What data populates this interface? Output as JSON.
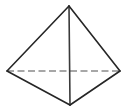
{
  "figure": {
    "shape_name": "tetrahedron",
    "background_color": "#ffffff",
    "visible_edge_color": "#262626",
    "hidden_edge_color": "#8a8a8a",
    "canvas": {
      "width": 127,
      "height": 111
    },
    "vertices": {
      "apex": {
        "label": "apex",
        "x": 69,
        "y": 6
      },
      "left": {
        "label": "left-rear",
        "x": 7,
        "y": 71
      },
      "right": {
        "label": "right-rear",
        "x": 120,
        "y": 71
      },
      "front": {
        "label": "front-bottom",
        "x": 70,
        "y": 105
      }
    },
    "edges": [
      {
        "name": "apex-to-left",
        "from": "apex",
        "to": "left",
        "style": "solid",
        "color": "#262626"
      },
      {
        "name": "apex-to-right",
        "from": "apex",
        "to": "right",
        "style": "solid",
        "color": "#262626"
      },
      {
        "name": "apex-to-front",
        "from": "apex",
        "to": "front",
        "style": "solid",
        "color": "#3a3a3a"
      },
      {
        "name": "left-to-front",
        "from": "left",
        "to": "front",
        "style": "solid",
        "color": "#262626"
      },
      {
        "name": "right-to-front",
        "from": "right",
        "to": "front",
        "style": "solid",
        "color": "#262626"
      },
      {
        "name": "left-to-right",
        "from": "left",
        "to": "right",
        "style": "dashed",
        "color": "#8a8a8a"
      }
    ],
    "dash_pattern": "7 3.5",
    "visible_stroke_width": 1.6,
    "hidden_stroke_width": 1.4
  }
}
